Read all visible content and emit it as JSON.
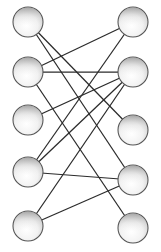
{
  "diagram": {
    "type": "bipartite-graph",
    "background_color": "#ffffff",
    "node": {
      "radius": 15,
      "stroke_color": "#555555",
      "fill_gradient_start": "#6e6e6e",
      "fill_gradient_mid": "#d4d4d4",
      "fill_gradient_end": "#fdfdfd",
      "label": ""
    },
    "edge": {
      "stroke_color": "#2b2b2b",
      "stroke_width": 1.25
    },
    "left_nodes": [
      {
        "id": "L1",
        "cx": 28,
        "cy": 22,
        "label": ""
      },
      {
        "id": "L2",
        "cx": 28,
        "cy": 72,
        "label": ""
      },
      {
        "id": "L3",
        "cx": 28,
        "cy": 120,
        "label": ""
      },
      {
        "id": "L4",
        "cx": 28,
        "cy": 172,
        "label": ""
      },
      {
        "id": "L5",
        "cx": 28,
        "cy": 226,
        "label": ""
      }
    ],
    "right_nodes": [
      {
        "id": "R1",
        "cx": 133,
        "cy": 22,
        "label": ""
      },
      {
        "id": "R2",
        "cx": 133,
        "cy": 72,
        "label": ""
      },
      {
        "id": "R3",
        "cx": 133,
        "cy": 130,
        "label": ""
      },
      {
        "id": "R4",
        "cx": 133,
        "cy": 180,
        "label": ""
      },
      {
        "id": "R5",
        "cx": 133,
        "cy": 228,
        "label": ""
      }
    ],
    "edges": [
      {
        "from": "L1",
        "to": "R4",
        "x1": 28,
        "y1": 22,
        "x2": 133,
        "y2": 180
      },
      {
        "from": "L2",
        "to": "R1",
        "x1": 28,
        "y1": 72,
        "x2": 133,
        "y2": 22
      },
      {
        "from": "L2",
        "to": "R2",
        "x1": 28,
        "y1": 72,
        "x2": 133,
        "y2": 72
      },
      {
        "from": "L3",
        "to": "R2",
        "x1": 28,
        "y1": 120,
        "x2": 133,
        "y2": 72
      },
      {
        "from": "L4",
        "to": "R1",
        "x1": 28,
        "y1": 172,
        "x2": 133,
        "y2": 22
      },
      {
        "from": "L4",
        "to": "R2",
        "x1": 28,
        "y1": 172,
        "x2": 133,
        "y2": 72
      },
      {
        "from": "L4",
        "to": "R4",
        "x1": 28,
        "y1": 172,
        "x2": 133,
        "y2": 180
      },
      {
        "from": "L5",
        "to": "R2",
        "x1": 28,
        "y1": 226,
        "x2": 133,
        "y2": 72
      },
      {
        "from": "L5",
        "to": "R4",
        "x1": 28,
        "y1": 226,
        "x2": 133,
        "y2": 180
      },
      {
        "from": "L2",
        "to": "R5",
        "x1": 28,
        "y1": 72,
        "x2": 133,
        "y2": 228
      },
      {
        "from": "L1",
        "to": "R3",
        "x1": 28,
        "y1": 22,
        "x2": 133,
        "y2": 130
      }
    ]
  }
}
